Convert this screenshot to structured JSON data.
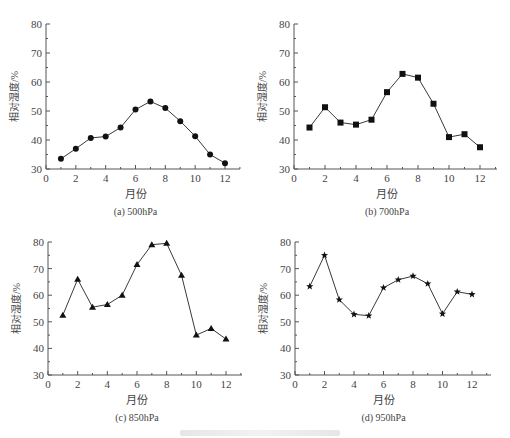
{
  "figure": {
    "caption_visible": false
  },
  "chart_data": [
    {
      "type": "line",
      "id": "a",
      "title": "(a) 500hPa",
      "xlabel": "月份",
      "ylabel": "相对湿度/%",
      "x": [
        1,
        2,
        3,
        4,
        5,
        6,
        7,
        8,
        9,
        10,
        11,
        12
      ],
      "series": [
        {
          "name": "500hPa",
          "marker": "circle",
          "values": [
            33.5,
            37.0,
            40.7,
            41.2,
            44.3,
            50.5,
            53.3,
            51.0,
            46.5,
            41.3,
            35.0,
            32.0
          ]
        }
      ],
      "xlim": [
        0,
        13
      ],
      "ylim": [
        30,
        80
      ],
      "xticks": [
        0,
        2,
        4,
        6,
        8,
        10,
        12
      ],
      "yticks": [
        30,
        40,
        50,
        60,
        70,
        80
      ],
      "grid": false,
      "legend": false
    },
    {
      "type": "line",
      "id": "b",
      "title": "(b) 700hPa",
      "xlabel": "月份",
      "ylabel": "相对湿度/%",
      "x": [
        1,
        2,
        3,
        4,
        5,
        6,
        7,
        8,
        9,
        10,
        11,
        12
      ],
      "series": [
        {
          "name": "700hPa",
          "marker": "square",
          "values": [
            44.3,
            51.3,
            46.0,
            45.3,
            47.0,
            56.5,
            62.8,
            61.5,
            52.5,
            41.0,
            42.0,
            37.5
          ]
        }
      ],
      "xlim": [
        0,
        13
      ],
      "ylim": [
        30,
        80
      ],
      "xticks": [
        0,
        2,
        4,
        6,
        8,
        10,
        12
      ],
      "yticks": [
        30,
        40,
        50,
        60,
        70,
        80
      ],
      "grid": false,
      "legend": false
    },
    {
      "type": "line",
      "id": "c",
      "title": "(c) 850hPa",
      "xlabel": "月份",
      "ylabel": "相对湿度/%",
      "x": [
        1,
        2,
        3,
        4,
        5,
        6,
        7,
        8,
        9,
        10,
        11,
        12
      ],
      "series": [
        {
          "name": "850hPa",
          "marker": "triangle",
          "values": [
            52.5,
            66.0,
            55.5,
            56.5,
            60.0,
            71.5,
            79.0,
            79.5,
            67.5,
            45.0,
            47.5,
            43.5
          ]
        }
      ],
      "xlim": [
        0,
        13
      ],
      "ylim": [
        30,
        80
      ],
      "xticks": [
        0,
        2,
        4,
        6,
        8,
        10,
        12
      ],
      "yticks": [
        30,
        40,
        50,
        60,
        70,
        80
      ],
      "grid": false,
      "legend": false
    },
    {
      "type": "line",
      "id": "d",
      "title": "(d) 950hPa",
      "xlabel": "月份",
      "ylabel": "相对湿度/%",
      "x": [
        1,
        2,
        3,
        4,
        5,
        6,
        7,
        8,
        9,
        10,
        11,
        12
      ],
      "series": [
        {
          "name": "950hPa",
          "marker": "star",
          "values": [
            63.3,
            75.0,
            58.3,
            52.8,
            52.3,
            62.8,
            65.8,
            67.2,
            64.3,
            53.0,
            61.3,
            60.3
          ]
        }
      ],
      "xlim": [
        0,
        13
      ],
      "ylim": [
        30,
        80
      ],
      "xticks": [
        0,
        2,
        4,
        6,
        8,
        10,
        12
      ],
      "yticks": [
        30,
        40,
        50,
        60,
        70,
        80
      ],
      "grid": false,
      "legend": false
    }
  ],
  "style": {
    "line_color": "#3a3a3a",
    "marker_color": "#111111",
    "axis_color": "#555555",
    "text_color": "#444444"
  }
}
